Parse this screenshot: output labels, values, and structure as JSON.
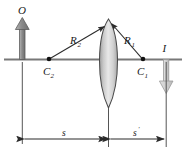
{
  "figure": {
    "type": "optics-ray-diagram",
    "background": "#ffffff",
    "line_color": "#2b2b2b",
    "axis_color": "#6e6e6e",
    "lens_fill_light": "#e4e4e4",
    "lens_fill_dark": "#9a9a9a",
    "object_arrow_color": "#8c8c8c",
    "image_arrow_color": "#c8c8c8"
  },
  "labels": {
    "object": "O",
    "image": "I",
    "radius_front_base": "R",
    "radius_front_sub": "1",
    "radius_back_base": "R",
    "radius_back_sub": "2",
    "center_front_base": "C",
    "center_front_sub": "1",
    "center_back_base": "C",
    "center_back_sub": "2",
    "object_distance": "s",
    "image_distance": "s",
    "image_distance_prime": "′"
  },
  "geometry": {
    "axis_y": 59,
    "axis_x_start": 4,
    "axis_x_end": 182,
    "object_x": 22,
    "lens_x": 108,
    "image_x": 166,
    "c1_x": 143,
    "c1_y": 59,
    "c2_x": 49,
    "c2_y": 59,
    "lens_top_y": 19,
    "lens_bottom_y": 108,
    "dim_line_y": 139,
    "object_arrow_top_y": 18,
    "image_arrow_bottom_y": 93
  }
}
